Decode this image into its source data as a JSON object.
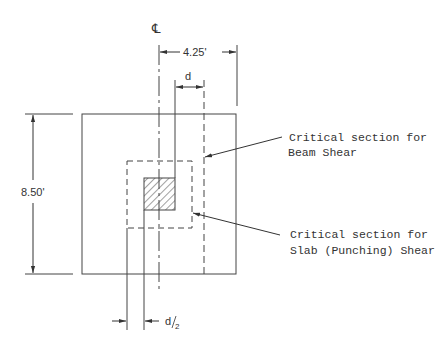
{
  "diagram": {
    "centerline_symbol": "℄",
    "dimensions": {
      "half_width": "4.25'",
      "full_width": "8.50'",
      "beam_shear_offset": "d",
      "punching_offset": "d/2",
      "punching_offset_num": "d",
      "punching_offset_den": "2"
    },
    "callouts": [
      {
        "line1": "Critical section for",
        "line2": "Beam Shear"
      },
      {
        "line1": "Critical section for",
        "line2": "Slab (Punching) Shear"
      }
    ],
    "colors": {
      "line": "#444444",
      "text": "#333333",
      "background": "#ffffff"
    }
  }
}
